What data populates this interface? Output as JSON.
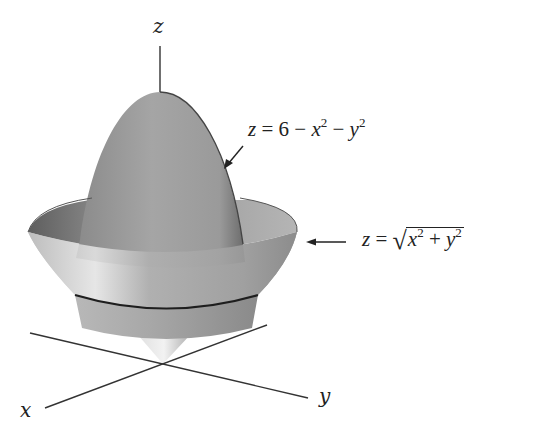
{
  "figure": {
    "axes": {
      "z_label": "z",
      "x_label": "x",
      "y_label": "y"
    },
    "surfaces": [
      {
        "name": "paraboloid",
        "equation_lhs": "z",
        "equation_parts": [
          "6",
          "x",
          "2",
          "y",
          "2"
        ],
        "equation_text": "z = 6 − x² − y²"
      },
      {
        "name": "cone",
        "equation_lhs": "z",
        "equation_parts": [
          "x",
          "2",
          "y",
          "2"
        ],
        "equation_text": "z = √(x² + y²)"
      }
    ],
    "intersection": "circle where paraboloid meets cone",
    "colors": {
      "surface_dark": "#6e6e6e",
      "surface_mid": "#9a9a9a",
      "surface_light": "#d8d8d8",
      "line": "#222222"
    }
  }
}
